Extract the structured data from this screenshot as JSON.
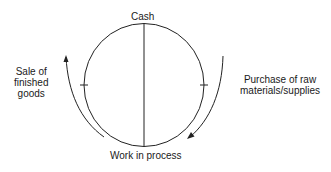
{
  "diagram": {
    "type": "cycle",
    "nodes": {
      "top": "Cash",
      "bottom": "Work in process"
    },
    "flows": {
      "left": {
        "line1": "Sale of",
        "line2": "finished",
        "line3": "goods",
        "direction": "upward"
      },
      "right": {
        "line1": "Purchase of raw",
        "line2": "materials/supplies",
        "direction": "downward"
      }
    },
    "colors": {
      "line": "#222222",
      "text": "#1a1a1a",
      "background": "#ffffff"
    }
  }
}
